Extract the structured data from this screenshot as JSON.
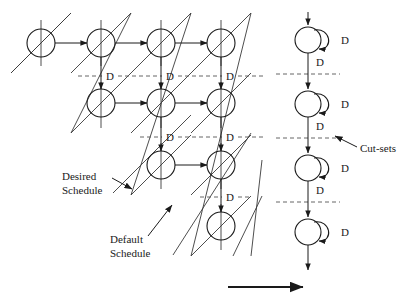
{
  "figure": {
    "background_color": "#ffffff",
    "stroke_color": "#1a1a1a",
    "dashed_color": "#555555"
  },
  "labels": {
    "delay": "D",
    "desired_schedule_line1": "Desired",
    "desired_schedule_line2": "Schedule",
    "default_schedule_line1": "Default",
    "default_schedule_line2": "Schedule",
    "cut_sets": "Cut-sets"
  },
  "left_graph": {
    "node_radius": 14,
    "rows": [
      {
        "y": 43,
        "nodes_x": [
          41,
          101,
          161,
          221
        ]
      },
      {
        "y": 103,
        "nodes_x": [
          101,
          161,
          221
        ]
      },
      {
        "y": 165,
        "nodes_x": [
          161,
          221
        ]
      },
      {
        "y": 226,
        "nodes_x": [
          221
        ]
      }
    ],
    "horizontal_edges": [
      {
        "x1": 41,
        "x2": 101,
        "y": 43
      },
      {
        "x1": 101,
        "x2": 161,
        "y": 43
      },
      {
        "x1": 161,
        "x2": 221,
        "y": 43
      },
      {
        "x1": 101,
        "x2": 161,
        "y": 103
      },
      {
        "x1": 161,
        "x2": 221,
        "y": 103
      },
      {
        "x1": 161,
        "x2": 221,
        "y": 165
      }
    ],
    "vertical_edges": [
      {
        "x": 101,
        "y1": 43,
        "y2": 103
      },
      {
        "x": 161,
        "y1": 43,
        "y2": 103
      },
      {
        "x": 221,
        "y1": 43,
        "y2": 103
      },
      {
        "x": 161,
        "y1": 103,
        "y2": 165
      },
      {
        "x": 221,
        "y1": 103,
        "y2": 165
      },
      {
        "x": 221,
        "y1": 165,
        "y2": 226
      }
    ],
    "cut_lines": [
      {
        "y": 76,
        "x1": 78,
        "x2": 262,
        "delay_labels_x": [
          110,
          170,
          230
        ]
      },
      {
        "y": 137,
        "x1": 140,
        "x2": 262,
        "delay_labels_x": [
          170,
          230
        ]
      },
      {
        "y": 197,
        "x1": 198,
        "x2": 262,
        "delay_labels_x": [
          230
        ]
      }
    ]
  },
  "right_chain": {
    "node_radius": 13,
    "center_x": 308,
    "nodes_y": [
      40,
      104,
      168,
      232
    ],
    "self_loop_delay_label": "D",
    "edge_delay_label": "D",
    "cut_lines_y": [
      74,
      138,
      202
    ],
    "input_arrow": {
      "x": 308,
      "y1": 12,
      "y2": 27
    },
    "output_arrow": {
      "x": 308,
      "y1": 245,
      "y2": 272
    }
  },
  "annotations": {
    "desired_schedule": {
      "text_x": 62,
      "text_y": 180,
      "arrow_from_x": 96,
      "arrow_from_y": 176,
      "arrow_to_x": 118,
      "arrow_to_y": 186
    },
    "default_schedule": {
      "text_x": 110,
      "text_y": 240,
      "arrow_from_x": 150,
      "arrow_from_y": 237,
      "arrow_to_x": 174,
      "arrow_to_y": 207
    },
    "cut_sets": {
      "text_x": 360,
      "text_y": 152,
      "arrow_from_x": 356,
      "arrow_from_y": 146,
      "arrow_to_x": 334,
      "arrow_to_y": 136
    }
  },
  "bottom_arrow": {
    "x1": 228,
    "x2": 305,
    "y": 287
  }
}
